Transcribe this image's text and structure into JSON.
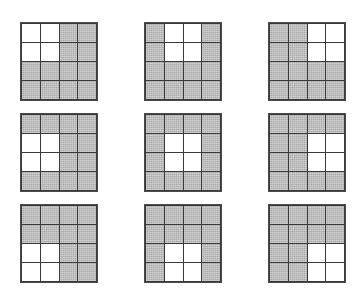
{
  "figure": {
    "colors": {
      "shaded_cell": "#a9a9a9",
      "unshaded_cell": "#ffffff",
      "grid_line": "#3a3a3a",
      "background": "#ffffff"
    },
    "grid_rows": 4,
    "grid_cols": 4,
    "panel_rows": 3,
    "panel_cols": 3,
    "panels": [
      {
        "id": "panel-1",
        "label": "top-left",
        "white_block_origin": {
          "row": 1,
          "col": 1
        },
        "cells": [
          [
            "white",
            "white",
            "gray",
            "gray"
          ],
          [
            "white",
            "white",
            "gray",
            "gray"
          ],
          [
            "gray",
            "gray",
            "gray",
            "gray"
          ],
          [
            "gray",
            "gray",
            "gray",
            "gray"
          ]
        ]
      },
      {
        "id": "panel-2",
        "label": "top-center",
        "white_block_origin": {
          "row": 1,
          "col": 2
        },
        "cells": [
          [
            "gray",
            "white",
            "white",
            "gray"
          ],
          [
            "gray",
            "white",
            "white",
            "gray"
          ],
          [
            "gray",
            "gray",
            "gray",
            "gray"
          ],
          [
            "gray",
            "gray",
            "gray",
            "gray"
          ]
        ]
      },
      {
        "id": "panel-3",
        "label": "top-right",
        "white_block_origin": {
          "row": 1,
          "col": 3
        },
        "cells": [
          [
            "gray",
            "gray",
            "white",
            "white"
          ],
          [
            "gray",
            "gray",
            "white",
            "white"
          ],
          [
            "gray",
            "gray",
            "gray",
            "gray"
          ],
          [
            "gray",
            "gray",
            "gray",
            "gray"
          ]
        ]
      },
      {
        "id": "panel-4",
        "label": "middle-left",
        "white_block_origin": {
          "row": 2,
          "col": 1
        },
        "cells": [
          [
            "gray",
            "gray",
            "gray",
            "gray"
          ],
          [
            "white",
            "white",
            "gray",
            "gray"
          ],
          [
            "white",
            "white",
            "gray",
            "gray"
          ],
          [
            "gray",
            "gray",
            "gray",
            "gray"
          ]
        ]
      },
      {
        "id": "panel-5",
        "label": "middle-center",
        "white_block_origin": {
          "row": 2,
          "col": 2
        },
        "cells": [
          [
            "gray",
            "gray",
            "gray",
            "gray"
          ],
          [
            "gray",
            "white",
            "white",
            "gray"
          ],
          [
            "gray",
            "white",
            "white",
            "gray"
          ],
          [
            "gray",
            "gray",
            "gray",
            "gray"
          ]
        ]
      },
      {
        "id": "panel-6",
        "label": "middle-right",
        "white_block_origin": {
          "row": 2,
          "col": 3
        },
        "cells": [
          [
            "gray",
            "gray",
            "gray",
            "gray"
          ],
          [
            "gray",
            "gray",
            "white",
            "white"
          ],
          [
            "gray",
            "gray",
            "white",
            "white"
          ],
          [
            "gray",
            "gray",
            "gray",
            "gray"
          ]
        ]
      },
      {
        "id": "panel-7",
        "label": "bottom-left",
        "white_block_origin": {
          "row": 3,
          "col": 1
        },
        "cells": [
          [
            "gray",
            "gray",
            "gray",
            "gray"
          ],
          [
            "gray",
            "gray",
            "gray",
            "gray"
          ],
          [
            "white",
            "white",
            "gray",
            "gray"
          ],
          [
            "white",
            "white",
            "gray",
            "gray"
          ]
        ]
      },
      {
        "id": "panel-8",
        "label": "bottom-center",
        "white_block_origin": {
          "row": 3,
          "col": 2
        },
        "cells": [
          [
            "gray",
            "gray",
            "gray",
            "gray"
          ],
          [
            "gray",
            "gray",
            "gray",
            "gray"
          ],
          [
            "gray",
            "white",
            "white",
            "gray"
          ],
          [
            "gray",
            "white",
            "white",
            "gray"
          ]
        ]
      },
      {
        "id": "panel-9",
        "label": "bottom-right",
        "white_block_origin": {
          "row": 3,
          "col": 3
        },
        "cells": [
          [
            "gray",
            "gray",
            "gray",
            "gray"
          ],
          [
            "gray",
            "gray",
            "gray",
            "gray"
          ],
          [
            "gray",
            "gray",
            "white",
            "white"
          ],
          [
            "gray",
            "gray",
            "white",
            "white"
          ]
        ]
      }
    ],
    "geometry": {
      "panel_width": 78,
      "panel_height": 79,
      "positions": [
        {
          "left": 20,
          "top": 22
        },
        {
          "left": 144,
          "top": 22
        },
        {
          "left": 268,
          "top": 22
        },
        {
          "left": 20,
          "top": 113
        },
        {
          "left": 144,
          "top": 113
        },
        {
          "left": 268,
          "top": 113
        },
        {
          "left": 20,
          "top": 204
        },
        {
          "left": 144,
          "top": 204
        },
        {
          "left": 268,
          "top": 204
        }
      ]
    }
  }
}
